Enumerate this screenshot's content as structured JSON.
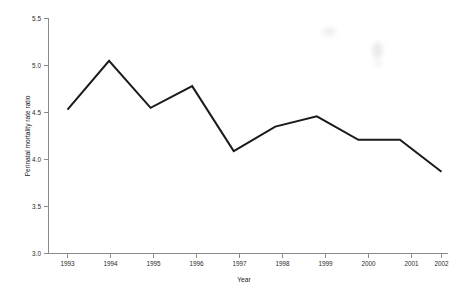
{
  "chart_data": {
    "type": "line",
    "title": "",
    "xlabel": "Year",
    "ylabel": "Perinatal mortality rate ratio",
    "categories": [
      "1993",
      "1994",
      "1995",
      "1996",
      "1997",
      "1998",
      "1999",
      "2000",
      "2001",
      "2002"
    ],
    "x": [
      1993,
      1994,
      1995,
      1996,
      1997,
      1998,
      1999,
      2000,
      2001,
      2002
    ],
    "values": [
      4.53,
      5.05,
      4.55,
      4.78,
      4.09,
      4.35,
      4.46,
      4.21,
      4.21,
      3.87
    ],
    "series": [
      {
        "name": "Perinatal mortality rate ratio",
        "values": [
          4.53,
          5.05,
          4.55,
          4.78,
          4.09,
          4.35,
          4.46,
          4.21,
          4.21,
          3.87
        ]
      }
    ],
    "ylim": [
      3.0,
      5.5
    ],
    "xlim": [
      1993,
      2002
    ],
    "ytick_labels": [
      "3.0",
      "3.5",
      "4.0",
      "4.5",
      "5.0",
      "5.5"
    ],
    "ytick_values": [
      3.0,
      3.5,
      4.0,
      4.5,
      5.0,
      5.5
    ],
    "xtick_labels": [
      "1993",
      "1994",
      "1995",
      "1996",
      "1997",
      "1998",
      "1999",
      "2000",
      "2001",
      "2002"
    ],
    "grid": false,
    "legend": "none",
    "line_color": "#1a1a1a",
    "axis_color": "#8a8a8a",
    "background_color": "#ffffff"
  },
  "axes": {
    "y_title": "Perinatal mortality rate ratio",
    "x_title": "Year"
  }
}
